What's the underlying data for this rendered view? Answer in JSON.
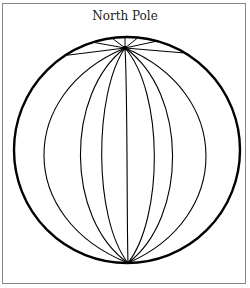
{
  "diagram": {
    "title": "North Pole",
    "globe": {
      "center": [
        127,
        150
      ],
      "radius": 113,
      "pole": [
        125,
        48
      ],
      "south_point": [
        128,
        263
      ],
      "meridian_midline_x": [
        45,
        81,
        102,
        127,
        154,
        172,
        205
      ],
      "stroke_color": "#000000"
    },
    "frame_color": "#888888"
  }
}
